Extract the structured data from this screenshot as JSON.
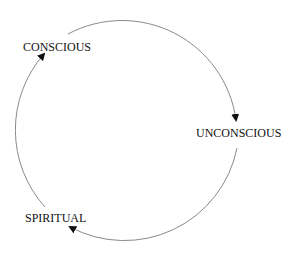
{
  "diagram": {
    "type": "cycle",
    "nodes": [
      {
        "id": "conscious",
        "label": "CONSCIOUS"
      },
      {
        "id": "unconscious",
        "label": "UNCONSCIOUS"
      },
      {
        "id": "spiritual",
        "label": "SPIRITUAL"
      }
    ],
    "edges": [
      {
        "from": "conscious",
        "to": "unconscious",
        "direction": "clockwise"
      },
      {
        "from": "unconscious",
        "to": "spiritual",
        "direction": "clockwise"
      },
      {
        "from": "spiritual",
        "to": "conscious",
        "direction": "clockwise"
      }
    ],
    "colors": {
      "line": "#8a8a8a",
      "arrowhead": "#111111",
      "text": "#111111",
      "background": "#ffffff"
    }
  }
}
